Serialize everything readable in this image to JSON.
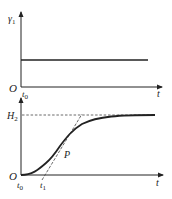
{
  "figure": {
    "top_plot": {
      "y_label": "γ",
      "y_label_sub": "1",
      "origin_label": "O",
      "x_label": "t",
      "x_tick_label": "t",
      "x_tick_sub": "0",
      "description": "constant step input"
    },
    "bottom_plot": {
      "y_level_label": "H",
      "y_level_sub": "2",
      "origin_label": "O",
      "x_label": "t",
      "x_tick0_label": "t",
      "x_tick0_sub": "0",
      "x_tick1_label": "t",
      "x_tick1_sub": "1",
      "inflection_label": "P",
      "description": "S-shaped step response with tangent at inflection point P"
    }
  },
  "colors": {
    "line": "#222222",
    "dashed": "#444444",
    "background": "#ffffff"
  }
}
